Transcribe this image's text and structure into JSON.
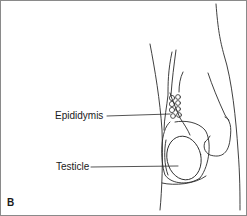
{
  "diagram": {
    "panel_letter": "B",
    "labels": [
      {
        "id": "epididymis",
        "text": "Epididymis"
      },
      {
        "id": "testicle",
        "text": "Testicle"
      }
    ],
    "colors": {
      "line": "#2a2a2a",
      "background": "#ffffff",
      "border": "#8a8a8a"
    }
  }
}
